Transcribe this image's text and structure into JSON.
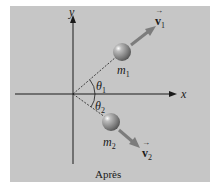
{
  "diagram": {
    "caption": "Après",
    "axes": {
      "x_label": "x",
      "y_label": "y"
    },
    "objects": [
      {
        "mass_label": "m",
        "mass_sub": "1",
        "velocity_label": "v",
        "velocity_sub": "1",
        "angle_label": "θ",
        "angle_sub": "1"
      },
      {
        "mass_label": "m",
        "mass_sub": "2",
        "velocity_label": "v",
        "velocity_sub": "2",
        "angle_label": "θ",
        "angle_sub": "2"
      }
    ],
    "colors": {
      "background": "#c6c6c6",
      "axis": "#1a1a1a",
      "arrow": "#7c7c7c",
      "ball": "#8a8a8a"
    }
  }
}
